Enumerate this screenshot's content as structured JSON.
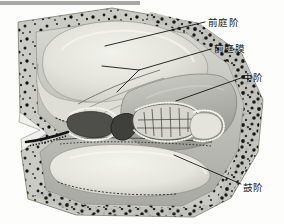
{
  "figure": {
    "kind": "anatomical-illustration",
    "background_color": "#fdfdfb",
    "top_bar": {
      "name": "top-gray-bar",
      "color": "#a8a8a8",
      "x": 0,
      "y": 1,
      "width": 140,
      "height": 4
    },
    "labels": [
      {
        "id": "scala-vestibuli",
        "text": "前庭阶",
        "x": 208,
        "y": 17,
        "leader": {
          "from_x": 205,
          "from_y": 22,
          "to_x": 105,
          "to_y": 46
        }
      },
      {
        "id": "vestibular-membrane",
        "text": "前庭膜",
        "x": 214,
        "y": 43,
        "leader": {
          "from_x": 211,
          "from_y": 49,
          "to_x": 139,
          "to_y": 70
        },
        "branch_a": {
          "from_x": 139,
          "from_y": 70,
          "to_x": 102,
          "to_y": 66
        },
        "branch_b": {
          "from_x": 139,
          "from_y": 70,
          "to_x": 117,
          "to_y": 92
        }
      },
      {
        "id": "scala-media",
        "text": "中阶",
        "x": 243,
        "y": 72,
        "leader": {
          "from_x": 241,
          "from_y": 78,
          "to_x": 176,
          "to_y": 101
        }
      },
      {
        "id": "scala-tympani",
        "text": "鼓阶",
        "x": 243,
        "y": 182,
        "leader": {
          "from_x": 241,
          "from_y": 184,
          "to_x": 174,
          "to_y": 155
        }
      }
    ],
    "regions": [
      {
        "id": "bone-outer",
        "name": "otic-capsule-bone",
        "tone": "#c9c9c4",
        "texture": "speckled"
      },
      {
        "id": "scala-vestibuli",
        "name": "scala-vestibuli",
        "tone": "#e6e6e0",
        "texture": "smooth"
      },
      {
        "id": "scala-media",
        "name": "scala-media",
        "tone": "#b9b9b4",
        "texture": "smooth"
      },
      {
        "id": "organ-of-corti",
        "name": "organ-of-corti",
        "tone": "#5a5a56",
        "texture": "cellular"
      },
      {
        "id": "scala-tympani",
        "name": "scala-tympani",
        "tone": "#e9e9e3",
        "texture": "smooth"
      }
    ],
    "line_color": "#1a1a1a",
    "line_width": 0.9
  }
}
